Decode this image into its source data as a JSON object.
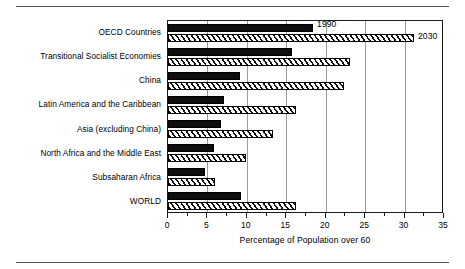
{
  "chart_data": {
    "type": "bar",
    "orientation": "horizontal",
    "title": "",
    "xlabel": "Percentage of Population over 60",
    "ylabel": "",
    "xlim": [
      0,
      35
    ],
    "xticks": [
      0,
      5,
      10,
      15,
      20,
      25,
      30,
      35
    ],
    "xtick_labels": [
      "0",
      "5",
      "10",
      "15",
      "20",
      "25",
      "30",
      "35"
    ],
    "minor_tick_step": 2.5,
    "grid": "vertical-major",
    "legend_position": "inline-callout",
    "categories": [
      "OECD Countries",
      "Transitional Socialist Economies",
      "China",
      "Latin America and the Caribbean",
      "Asia (excluding China)",
      "North Africa and the Middle East",
      "Subsaharan Africa",
      "WORLD"
    ],
    "series": [
      {
        "name": "1990",
        "style": "solid-black",
        "color": "#0d0d0d",
        "values": [
          18.4,
          15.7,
          9.1,
          7.1,
          6.7,
          5.8,
          4.7,
          9.3
        ]
      },
      {
        "name": "2030",
        "style": "diagonal-hatch",
        "color": "#ffffff",
        "values": [
          31.2,
          23.1,
          22.3,
          16.2,
          13.3,
          9.9,
          6.0,
          16.2
        ]
      }
    ],
    "annotations": [
      {
        "text": "1990",
        "series": "1990",
        "category": "OECD Countries"
      },
      {
        "text": "2030",
        "series": "2030",
        "category": "OECD Countries"
      }
    ]
  }
}
